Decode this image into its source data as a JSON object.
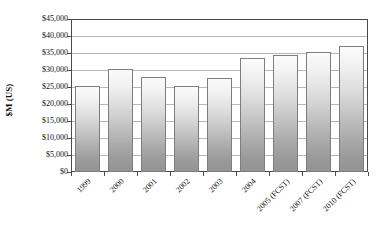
{
  "chart": {
    "type": "bar",
    "ylabel": "$M (US)",
    "background_color": "#ffffff",
    "bar_border_color": "#7d7d7d",
    "gridline_color": "#b8b8b8",
    "axis_color": "#4a4a4a"
  },
  "chart_data": {
    "type": "bar",
    "title": "",
    "subtitle": "",
    "xlabel": "",
    "ylabel": "$M (US)",
    "ylim": [
      0,
      45000
    ],
    "ytick_interval": 5000,
    "grid": true,
    "legend": false,
    "categories": [
      "1999",
      "2000",
      "2001",
      "2002",
      "2003",
      "2004",
      "2005 (FCST)",
      "2007 (FCST)",
      "2010 (FCST)"
    ],
    "values": [
      25400,
      30400,
      28000,
      25400,
      27700,
      33600,
      34300,
      35200,
      37200
    ],
    "ytick_labels": [
      "$45,000",
      "$40,000",
      "$35,000",
      "$30,000",
      "$25,000",
      "$20,000",
      "$15,000",
      "$10,000",
      "$5,000",
      "$0"
    ],
    "ytick_values": [
      45000,
      40000,
      35000,
      30000,
      25000,
      20000,
      15000,
      10000,
      5000,
      0
    ]
  }
}
